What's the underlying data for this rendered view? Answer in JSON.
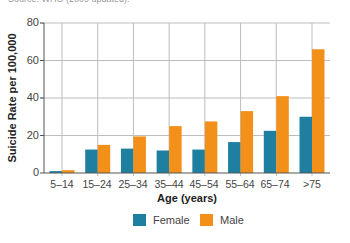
{
  "caption": "Source: WHO (2009 updated).",
  "colors": {
    "female": "#1f7fa0",
    "male": "#f39019",
    "grid": "#bdbdbd",
    "axis": "#555555"
  },
  "legend": [
    {
      "label": "Female",
      "color": "#1f7fa0"
    },
    {
      "label": "Male",
      "color": "#f39019"
    }
  ],
  "chart_data": {
    "type": "bar",
    "title": "",
    "xlabel": "Age (years)",
    "ylabel": "Suicide Rate per 100,000",
    "ylim": [
      0,
      80
    ],
    "yticks": [
      0,
      20,
      40,
      60,
      80
    ],
    "grid": true,
    "legend_position": "bottom",
    "categories": [
      "5–14",
      "15–24",
      "25–34",
      "35–44",
      "45–54",
      "55–64",
      "65–74",
      ">75"
    ],
    "series": [
      {
        "name": "Female",
        "color": "#1f7fa0",
        "values": [
          1,
          12.5,
          13,
          12,
          12.5,
          16.5,
          22.5,
          30
        ]
      },
      {
        "name": "Male",
        "color": "#f39019",
        "values": [
          1.5,
          15,
          19.5,
          25,
          27.5,
          33,
          41,
          66
        ]
      }
    ]
  }
}
